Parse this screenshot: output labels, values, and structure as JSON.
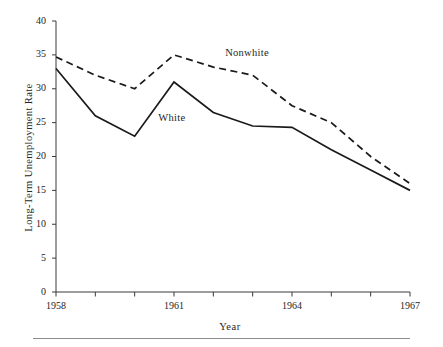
{
  "chart_data": {
    "type": "line",
    "title": "",
    "xlabel": "Year",
    "ylabel": "Long-Term Unemployment Rate",
    "x": [
      1958,
      1959,
      1960,
      1961,
      1962,
      1963,
      1964,
      1965,
      1966,
      1967
    ],
    "xlim": [
      1958,
      1967
    ],
    "ylim": [
      0,
      40
    ],
    "xticks": [
      1958,
      1959,
      1960,
      1961,
      1962,
      1963,
      1964,
      1965,
      1966,
      1967
    ],
    "xtick_labels": [
      "1958",
      "",
      "",
      "1961",
      "",
      "",
      "1964",
      "",
      "",
      "1967"
    ],
    "yticks": [
      0,
      5,
      10,
      15,
      20,
      25,
      30,
      35,
      40
    ],
    "ytick_labels": [
      "0",
      "5",
      "10",
      "15",
      "20",
      "25",
      "30",
      "35",
      "40"
    ],
    "grid": false,
    "legend_position": "inline-annotation",
    "series": [
      {
        "name": "Nonwhite",
        "style": "dashed",
        "color": "#1a1a1a",
        "values": [
          34.7,
          32.0,
          30.0,
          35.0,
          33.2,
          32.0,
          27.5,
          25.0,
          20.0,
          16.0
        ]
      },
      {
        "name": "White",
        "style": "solid",
        "color": "#1a1a1a",
        "values": [
          33.0,
          26.0,
          23.0,
          31.0,
          26.5,
          24.5,
          24.3,
          21.0,
          18.0,
          15.0
        ]
      }
    ],
    "annotations": [
      {
        "text": "Nonwhite",
        "x": 1962.3,
        "y": 35.2
      },
      {
        "text": "White",
        "x": 1960.6,
        "y": 25.6
      }
    ]
  }
}
